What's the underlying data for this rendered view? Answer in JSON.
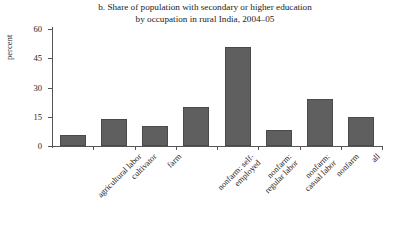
{
  "chart_data": {
    "type": "bar",
    "title": "b. Share of population with secondary or higher education\nby occupation in rural India, 2004–05",
    "title_line1": "b. Share of population with secondary or higher education",
    "title_line2": "by occupation in rural India, 2004–05",
    "xlabel": "",
    "ylabel": "percent",
    "ylim": [
      0,
      60
    ],
    "yticks": [
      0,
      15,
      30,
      45,
      60
    ],
    "ytick_labels": [
      "0",
      "15",
      "30",
      "45",
      "60"
    ],
    "grid": false,
    "legend": false,
    "bar_color": "#5f5f5f",
    "axis_color": "#555555",
    "categories": [
      "agricultural labor",
      "cultivator",
      "farm",
      "nonfarm: self-\nemployed",
      "nonfarm:\nregular labor",
      "nonfarm:\ncasual labor",
      "nonfarm",
      "all"
    ],
    "values": [
      5.5,
      14,
      10.5,
      20,
      51,
      8,
      24,
      15
    ]
  }
}
